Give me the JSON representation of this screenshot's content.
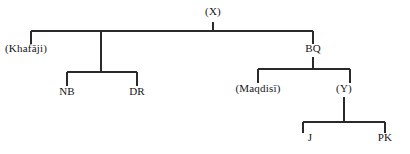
{
  "diagram": {
    "type": "stemma-tree",
    "title": "",
    "background_color": "#ffffff",
    "line_color": "#2a2a2a",
    "text_color": "#151515",
    "width": 410,
    "height": 154,
    "nodes": [
      {
        "id": "X",
        "label": "(X)",
        "x": 213,
        "y": 17,
        "anchor": "center",
        "level": 0
      },
      {
        "id": "Khafaji",
        "label": "(Khafāji)",
        "x": 5,
        "y": 53,
        "anchor": "left",
        "level": 1
      },
      {
        "id": "BQ",
        "label": "BQ",
        "x": 313,
        "y": 53,
        "anchor": "center",
        "level": 1
      },
      {
        "id": "NB",
        "label": "NB",
        "x": 67,
        "y": 95,
        "anchor": "center",
        "level": 2
      },
      {
        "id": "DR",
        "label": "DR",
        "x": 137,
        "y": 95,
        "anchor": "center",
        "level": 2
      },
      {
        "id": "Maqdisi",
        "label": "(Maqdisī)",
        "x": 258,
        "y": 92,
        "anchor": "center",
        "level": 2
      },
      {
        "id": "Y",
        "label": "(Y)",
        "x": 344,
        "y": 92,
        "anchor": "center",
        "level": 2
      },
      {
        "id": "J",
        "label": "J",
        "x": 310,
        "y": 141,
        "anchor": "center",
        "level": 3
      },
      {
        "id": "PK",
        "label": "PK",
        "x": 385,
        "y": 141,
        "anchor": "center",
        "level": 3
      }
    ],
    "edges": [
      {
        "from": "X",
        "to": "Khafaji",
        "kind": "bracket"
      },
      {
        "from": "X",
        "to": "middle",
        "kind": "bracket"
      },
      {
        "from": "X",
        "to": "BQ",
        "kind": "bracket"
      },
      {
        "from": "middle",
        "to": "NB",
        "kind": "bracket"
      },
      {
        "from": "middle",
        "to": "DR",
        "kind": "bracket"
      },
      {
        "from": "BQ",
        "to": "Maqdisi",
        "kind": "bracket"
      },
      {
        "from": "BQ",
        "to": "Y",
        "kind": "bracket"
      },
      {
        "from": "Y",
        "to": "J",
        "kind": "bracket"
      },
      {
        "from": "Y",
        "to": "PK",
        "kind": "bracket"
      }
    ]
  }
}
